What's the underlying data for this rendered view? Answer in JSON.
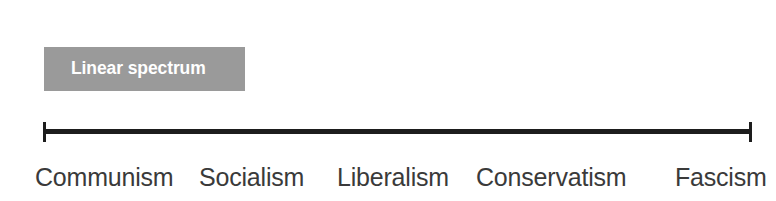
{
  "figure": {
    "title_chip": {
      "label": "Linear spectrum",
      "background_color": "#9a9a9a",
      "text_color": "#ffffff"
    },
    "axis": {
      "line_color": "#1d1d1d",
      "orientation": "horizontal",
      "left_cap": "tick-cap",
      "right_cap": "tick-cap"
    },
    "labels": [
      {
        "text": "Communism"
      },
      {
        "text": "Socialism"
      },
      {
        "text": "Liberalism"
      },
      {
        "text": "Conservatism"
      },
      {
        "text": "Fascism"
      }
    ],
    "background_color": "#ffffff",
    "label_color": "#3a3a3a"
  },
  "chart_data": {
    "type": "line",
    "title": "Linear spectrum",
    "xlabel": "",
    "ylabel": "",
    "categories": [
      "Communism",
      "Socialism",
      "Liberalism",
      "Conservatism",
      "Fascism"
    ],
    "values": [
      0,
      1,
      2,
      3,
      4
    ],
    "x": [
      0,
      1,
      2,
      3,
      4
    ],
    "xlim": [
      0,
      4
    ],
    "grid": false,
    "legend": "none",
    "annotations": [
      "Linear spectrum"
    ]
  }
}
